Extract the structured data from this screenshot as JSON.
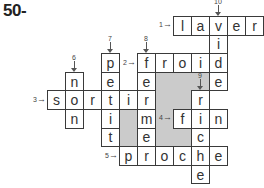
{
  "title": "50-",
  "grid": {
    "origin_x": 47,
    "origin_y": 16,
    "cell_w": 18,
    "cell_h": 18.6
  },
  "colors": {
    "shade": "#cbcbcb",
    "border": "#3a3a3a"
  },
  "shaded": [
    {
      "col": 4,
      "row": 5
    },
    {
      "col": 4,
      "row": 6
    },
    {
      "col": 6,
      "row": 3
    },
    {
      "col": 6,
      "row": 4
    },
    {
      "col": 6,
      "row": 5
    },
    {
      "col": 6,
      "row": 6
    },
    {
      "col": 7,
      "row": 3
    },
    {
      "col": 7,
      "row": 4
    },
    {
      "col": 7,
      "row": 6
    },
    {
      "col": 8,
      "row": 3
    }
  ],
  "words": [
    {
      "number": "1",
      "direction": "across",
      "answer": "laver",
      "col": 7,
      "row": 0
    },
    {
      "number": "2",
      "direction": "across",
      "answer": "froid",
      "col": 5,
      "row": 2
    },
    {
      "number": "3",
      "direction": "across",
      "answer": "sortir",
      "col": 0,
      "row": 4
    },
    {
      "number": "4",
      "direction": "across",
      "answer": "fin",
      "col": 7,
      "row": 5
    },
    {
      "number": "5",
      "direction": "across",
      "answer": "proche",
      "col": 4,
      "row": 7
    },
    {
      "number": "6",
      "direction": "down",
      "answer": "non",
      "col": 1,
      "row": 3
    },
    {
      "number": "7",
      "direction": "down",
      "answer": "petit",
      "col": 3,
      "row": 2
    },
    {
      "number": "8",
      "direction": "down",
      "answer": "ferme",
      "col": 5,
      "row": 2
    },
    {
      "number": "9",
      "direction": "down",
      "answer": "riche",
      "col": 8,
      "row": 4
    },
    {
      "number": "10",
      "direction": "down",
      "answer": "vide",
      "col": 9,
      "row": 0
    }
  ]
}
